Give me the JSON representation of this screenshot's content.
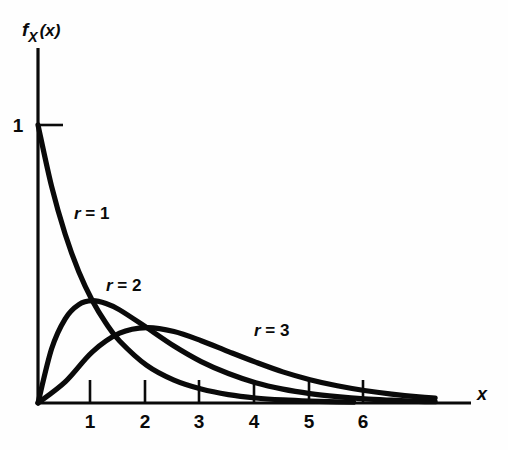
{
  "figure": {
    "background_color": "#fefefe",
    "ink_color": "#0a0a0a"
  },
  "axes": {
    "y_axis_label": "f_X(x)",
    "y_axis_label_parts": {
      "function": "f",
      "subscript": "X",
      "argument": "(x)"
    },
    "x_axis_label": "x",
    "y_tick_labels": [
      "1"
    ],
    "x_tick_labels": [
      "1",
      "2",
      "3",
      "4",
      "5",
      "6"
    ]
  },
  "annotations": [
    {
      "text": "r = 1",
      "var": "r",
      "rest": " = 1"
    },
    {
      "text": "r = 2",
      "var": "r",
      "rest": " = 2"
    },
    {
      "text": "r = 3",
      "var": "r",
      "rest": " = 3"
    }
  ],
  "chart_data": {
    "type": "line",
    "title": "",
    "subtitle": "",
    "xlabel": "x",
    "ylabel": "f_X(x)",
    "xlim": [
      0,
      8
    ],
    "ylim": [
      0,
      1.12
    ],
    "grid": false,
    "legend_position": "inline-annotations",
    "x_ticks": [
      1,
      2,
      3,
      4,
      5,
      6
    ],
    "y_ticks": [
      1
    ],
    "series": [
      {
        "name": "r = 1",
        "label": "r = 1",
        "r": 1,
        "peak_x": 0,
        "peak_y": 1.0,
        "x": [
          0,
          0.25,
          0.5,
          0.75,
          1.0,
          1.25,
          1.5,
          2.0,
          2.5,
          3.0,
          3.5,
          4.0,
          4.5,
          5.0,
          5.5,
          5.8
        ],
        "values": [
          1.0,
          0.779,
          0.607,
          0.472,
          0.368,
          0.287,
          0.223,
          0.135,
          0.082,
          0.05,
          0.03,
          0.018,
          0.011,
          0.0067,
          0.0041,
          0.003
        ]
      },
      {
        "name": "r = 2",
        "label": "r = 2",
        "r": 2,
        "peak_x": 1.0,
        "peak_y": 0.368,
        "x": [
          0,
          0.25,
          0.5,
          0.75,
          1.0,
          1.25,
          1.5,
          2.0,
          2.5,
          3.0,
          3.5,
          4.0,
          4.5,
          5.0,
          5.5,
          6.0,
          6.5,
          7.0,
          7.3
        ],
        "values": [
          0.0,
          0.195,
          0.303,
          0.354,
          0.368,
          0.358,
          0.335,
          0.271,
          0.205,
          0.149,
          0.106,
          0.073,
          0.05,
          0.034,
          0.023,
          0.015,
          0.01,
          0.006,
          0.005
        ]
      },
      {
        "name": "r = 3",
        "label": "r = 3",
        "r": 3,
        "peak_x": 2.0,
        "peak_y": 0.271,
        "x": [
          0,
          0.5,
          1.0,
          1.5,
          2.0,
          2.5,
          3.0,
          3.5,
          4.0,
          4.5,
          5.0,
          5.5,
          6.0,
          6.5,
          7.0,
          7.3
        ],
        "values": [
          0.0,
          0.076,
          0.184,
          0.251,
          0.271,
          0.257,
          0.224,
          0.185,
          0.147,
          0.112,
          0.084,
          0.062,
          0.045,
          0.032,
          0.022,
          0.018
        ]
      }
    ]
  }
}
